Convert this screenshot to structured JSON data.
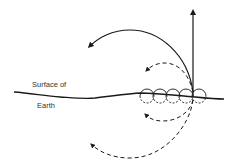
{
  "diagram": {
    "labels": {
      "surface_line1": "Surface of",
      "surface_line2": "Earth"
    },
    "elements": {
      "vertical_arrow": "solid upward arrow from surface point",
      "solid_arc": "solid curved arrow arcing up and left",
      "upper_dashed_arc": "short dashed curved arrow above surface",
      "lower_dashed_arc_small": "short dashed curved arrow below surface",
      "lower_dashed_arc_large": "long dashed curved arrow below surface",
      "circles": "row of five small circles along surface"
    },
    "colors": {
      "stroke": "#1a1a1a",
      "background": "#ffffff"
    }
  }
}
